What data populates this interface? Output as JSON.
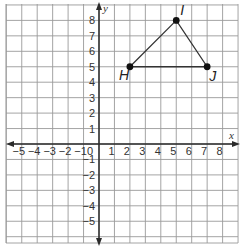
{
  "chart_data": {
    "type": "scatter",
    "title": "",
    "xlabel": "x",
    "ylabel": "y",
    "xlim": [
      -6,
      9
    ],
    "ylim": [
      -6,
      9
    ],
    "grid": true,
    "x_ticks": [
      -5,
      -4,
      -3,
      -2,
      -1,
      0,
      1,
      2,
      3,
      4,
      5,
      6,
      7,
      8
    ],
    "y_ticks": [
      8,
      7,
      6,
      5,
      4,
      3,
      2,
      1,
      -1,
      -2,
      -3,
      -4,
      -5
    ],
    "x_tick_labels": [
      "−5",
      "−4",
      "−3",
      "−2",
      "−1",
      "0",
      "1",
      "2",
      "3",
      "4",
      "5",
      "6",
      "7",
      "8"
    ],
    "y_tick_labels": [
      "8",
      "7",
      "6",
      "5",
      "4",
      "3",
      "2",
      "1",
      "−1",
      "−2",
      "−3",
      "−4",
      "−5"
    ],
    "points": [
      {
        "label": "H",
        "x": 2,
        "y": 5
      },
      {
        "label": "I",
        "x": 5,
        "y": 8
      },
      {
        "label": "J",
        "x": 7,
        "y": 5
      }
    ],
    "polygon": [
      "H",
      "I",
      "J"
    ]
  }
}
